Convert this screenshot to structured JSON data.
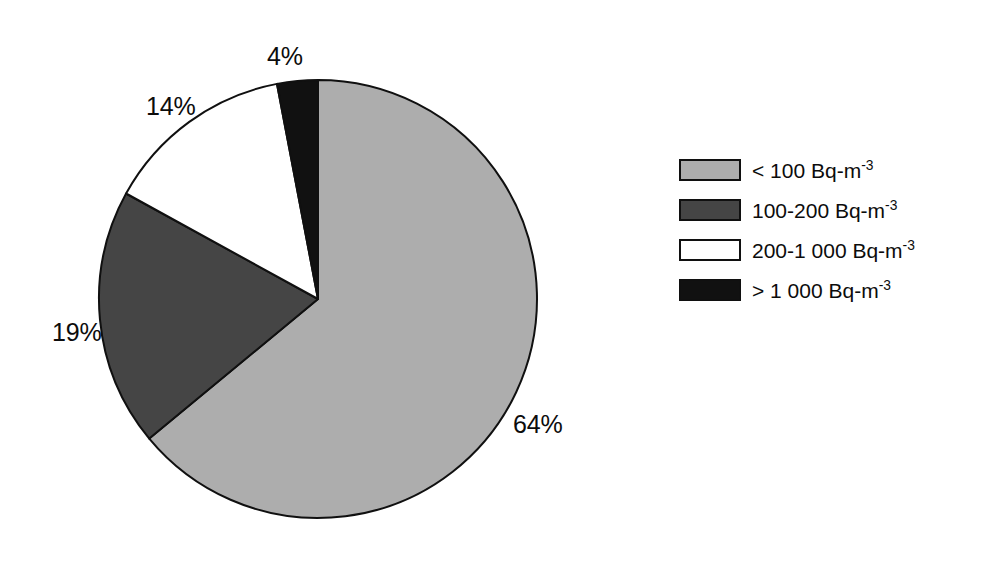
{
  "chart_data": {
    "type": "pie",
    "title": "",
    "subtitle": "",
    "xlabel": "",
    "ylabel": "",
    "grid": false,
    "legend_position": "right",
    "center": {
      "x": 318,
      "y": 299
    },
    "radius": 219,
    "start_angle_deg": 0,
    "direction": "clockwise",
    "unit": "percent",
    "categories": [
      "< 100 Bq-m-3",
      "100-200 Bq-m-3",
      "200-1 000 Bq-m-3",
      "> 1 000 Bq-m-3"
    ],
    "values": [
      64,
      19,
      14,
      4
    ],
    "data_labels": [
      "64%",
      "19%",
      "14%",
      "4%"
    ],
    "colors": [
      "#adadad",
      "#454545",
      "#ffffff",
      "#111111"
    ],
    "slices": [
      {
        "label": "< 100 Bq-m-3",
        "value": 64,
        "data_label": "64%",
        "color": "#adadad",
        "start_deg": 0,
        "end_deg": 230.4
      },
      {
        "label": "100-200 Bq-m-3",
        "value": 19,
        "data_label": "19%",
        "color": "#454545",
        "start_deg": 230.4,
        "end_deg": 298.8
      },
      {
        "label": "200-1 000 Bq-m-3",
        "value": 14,
        "data_label": "14%",
        "color": "#ffffff",
        "start_deg": 298.8,
        "end_deg": 349.2
      },
      {
        "label": "> 1 000 Bq-m-3",
        "value": 4,
        "data_label": "4%",
        "color": "#111111",
        "start_deg": 349.2,
        "end_deg": 360
      }
    ],
    "stroke_color": "#101010",
    "stroke_width": 2
  },
  "pie_labels": {
    "light_gray": "64%",
    "dark_gray": "19%",
    "white": "14%",
    "black": "4%"
  },
  "legend": {
    "items": [
      {
        "swatch_name": "legend-swatch-light-gray",
        "color": "#adadad",
        "prefix": "< 100 Bq-m",
        "exponent": "-3"
      },
      {
        "swatch_name": "legend-swatch-dark-gray",
        "color": "#454545",
        "prefix": "100-200 Bq-m",
        "exponent": "-3"
      },
      {
        "swatch_name": "legend-swatch-white",
        "color": "#ffffff",
        "prefix": "200-1 000 Bq-m",
        "exponent": "-3"
      },
      {
        "swatch_name": "legend-swatch-black",
        "color": "#111111",
        "prefix": "> 1 000 Bq-m",
        "exponent": "-3"
      }
    ]
  }
}
